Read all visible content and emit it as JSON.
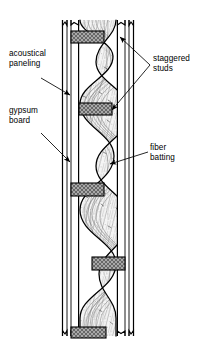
{
  "figure": {
    "type": "technical-cutaway-diagram",
    "width": 204,
    "height": 344,
    "background": "#ffffff",
    "ink": "#000000"
  },
  "labels": {
    "acoustical_paneling": "acoustical\npaneling",
    "gypsum_board": "gypsum\nboard",
    "staggered_studs": "staggered\nstuds",
    "fiber_batting": "fiber\nbatting"
  },
  "components": {
    "left_wall": {
      "name": "left wall assembly",
      "x_outer": 62,
      "x_inner": 79,
      "layers": [
        "acoustical paneling",
        "gypsum board"
      ],
      "fill": "#ffffff",
      "stroke": "#000000"
    },
    "right_wall": {
      "name": "right wall assembly",
      "x_inner": 117,
      "x_outer": 134,
      "layers": [
        "gypsum board",
        "acoustical paneling"
      ],
      "fill": "#ffffff",
      "stroke": "#000000"
    },
    "studs": {
      "name": "staggered studs",
      "count": 5,
      "fill": "#9a9a9a",
      "hatch": "crosshatch",
      "stroke": "#000000",
      "items": [
        {
          "side": "left",
          "y": 31,
          "height": 12
        },
        {
          "side": "right",
          "y": 103,
          "height": 12
        },
        {
          "side": "left",
          "y": 183,
          "height": 13
        },
        {
          "side": "right",
          "y": 257,
          "height": 13
        },
        {
          "side": "left",
          "y": 327,
          "height": 11
        }
      ]
    },
    "batting": {
      "name": "fiber batting",
      "form": "serpentine blanket woven between studs",
      "fill": "#f4f4f4",
      "fiber_stroke": "#5a5a5a"
    },
    "break_marks": {
      "name": "cut-away break marks",
      "top": true,
      "bottom": true
    }
  },
  "leaders": {
    "acoustical_paneling": {
      "arrow": "right",
      "from": [
        63,
        73
      ],
      "to": [
        71,
        96
      ]
    },
    "gypsum_board": {
      "arrow": "right",
      "from": [
        63,
        130
      ],
      "to": [
        71,
        163
      ]
    },
    "staggered_studs": {
      "arrow": "left",
      "branches": 2,
      "tips": [
        [
          107,
          36
        ],
        [
          112,
          110
        ]
      ]
    },
    "fiber_batting": {
      "arrow": "left",
      "from": [
        148,
        154
      ],
      "to": [
        106,
        163
      ]
    }
  }
}
